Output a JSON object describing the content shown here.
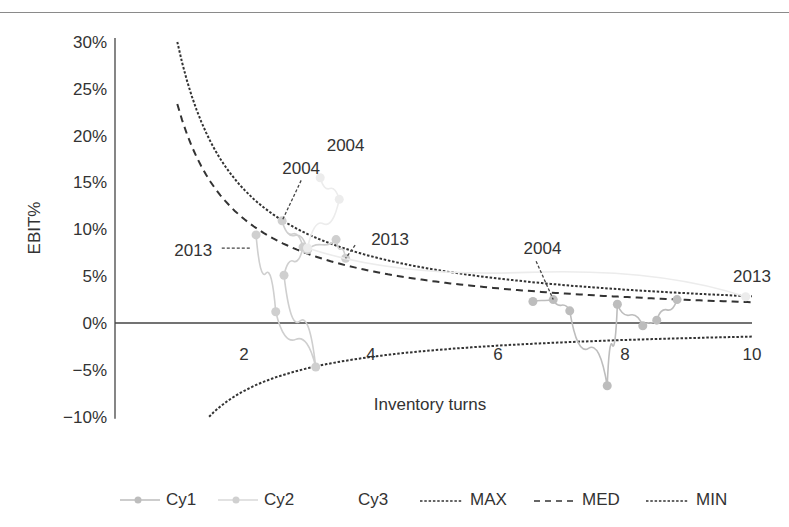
{
  "chart_data": {
    "type": "line",
    "title": "",
    "xlabel": "Inventory turns",
    "ylabel": "EBIT%",
    "xlim": [
      0,
      10
    ],
    "ylim": [
      -10,
      30
    ],
    "x_ticks": [
      "2",
      "4",
      "6",
      "8",
      "10"
    ],
    "x_tick_values": [
      2,
      4,
      6,
      8,
      10
    ],
    "y_ticks": [
      "30%",
      "25%",
      "20%",
      "15%",
      "10%",
      "5%",
      "0%",
      "−5%",
      "−10%"
    ],
    "y_tick_values": [
      30,
      25,
      20,
      15,
      10,
      5,
      0,
      -5,
      -10
    ],
    "grid": false,
    "zero_line": true,
    "legend_position": "bottom",
    "series": [
      {
        "name": "Cy1",
        "style": "solid-marker",
        "color": "#bdbdbd",
        "points": [
          {
            "x": 6.55,
            "y": 2.3
          },
          {
            "x": 6.87,
            "y": 2.5,
            "label": "2004"
          },
          {
            "x": 7.13,
            "y": 1.3
          },
          {
            "x": 7.72,
            "y": -6.7
          },
          {
            "x": 7.88,
            "y": 2.0
          },
          {
            "x": 8.28,
            "y": -0.3
          },
          {
            "x": 8.5,
            "y": 0.3
          },
          {
            "x": 8.82,
            "y": 2.5
          }
        ]
      },
      {
        "name": "Cy2",
        "style": "solid-marker",
        "color": "#cfcfcf",
        "points": [
          {
            "x": 2.19,
            "y": 9.4,
            "label": "2013"
          },
          {
            "x": 2.5,
            "y": 1.2
          },
          {
            "x": 3.13,
            "y": -4.7
          },
          {
            "x": 2.63,
            "y": 5.1
          },
          {
            "x": 2.93,
            "y": 8.1
          },
          {
            "x": 2.6,
            "y": 10.9,
            "label": "2004"
          },
          {
            "x": 3.0,
            "y": 7.8
          },
          {
            "x": 3.45,
            "y": 8.9
          },
          {
            "x": 3.6,
            "y": 6.9,
            "label": "2013"
          }
        ]
      },
      {
        "name": "Cy3",
        "style": "solid-marker",
        "color": "#ececec",
        "points": [
          {
            "x": 3.2,
            "y": 15.5,
            "label": "2004"
          },
          {
            "x": 3.5,
            "y": 13.2
          },
          {
            "x": 3.0,
            "y": 8.0
          },
          {
            "x": 9.9,
            "y": 2.8,
            "label": "2013"
          }
        ]
      },
      {
        "name": "MAX",
        "style": "dotted",
        "color": "#333333",
        "formula": "28.5 / x",
        "x": [
          0.95,
          1.5,
          2,
          2.5,
          3,
          4,
          5,
          6,
          7,
          8,
          9,
          10
        ],
        "values": [
          30.0,
          19.0,
          14.25,
          11.4,
          9.5,
          7.13,
          5.7,
          4.75,
          4.07,
          3.56,
          3.17,
          2.85
        ]
      },
      {
        "name": "MED",
        "style": "dashed",
        "color": "#333333",
        "formula": "22.2 / x",
        "x": [
          0.95,
          1.5,
          2,
          2.5,
          3,
          4,
          5,
          6,
          7,
          8,
          9,
          10
        ],
        "values": [
          23.4,
          14.8,
          11.1,
          8.88,
          7.4,
          5.55,
          4.44,
          3.7,
          3.17,
          2.78,
          2.47,
          2.22
        ]
      },
      {
        "name": "MIN",
        "style": "dotted",
        "color": "#333333",
        "formula": "-14.5 / x",
        "x": [
          1.45,
          2,
          3,
          4,
          5,
          6,
          7,
          8,
          9,
          10
        ],
        "values": [
          -10.0,
          -7.25,
          -4.83,
          -3.63,
          -2.9,
          -2.42,
          -2.07,
          -1.81,
          -1.61,
          -1.45
        ]
      }
    ],
    "annotations": [
      {
        "text": "2004",
        "x": 2.9,
        "y": 16.5
      },
      {
        "text": "2004",
        "x": 3.6,
        "y": 19.0
      },
      {
        "text": "2013",
        "x": 1.2,
        "y": 7.8
      },
      {
        "text": "2013",
        "x": 4.3,
        "y": 9.0
      },
      {
        "text": "2004",
        "x": 6.7,
        "y": 8.0
      },
      {
        "text": "2013",
        "x": 10.0,
        "y": 5.0
      }
    ]
  },
  "legend": {
    "items": [
      {
        "label": "Cy1"
      },
      {
        "label": "Cy2"
      },
      {
        "label": "Cy3"
      },
      {
        "label": "MAX"
      },
      {
        "label": "MED"
      },
      {
        "label": "MIN"
      }
    ]
  }
}
